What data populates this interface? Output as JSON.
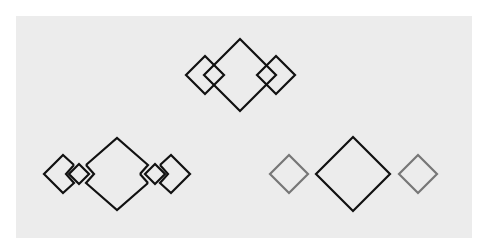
{
  "canvas": {
    "background": "#ffffff",
    "panel_color": "#ececec"
  },
  "colors": {
    "dark": "#111111",
    "gray": "#777777",
    "panel": "#ececec"
  },
  "figures": [
    {
      "name": "top-group",
      "description": "large diamond overlapped by two small diamonds on each tip",
      "big": {
        "cx": 240,
        "cy": 75,
        "r": 36
      },
      "small": [
        {
          "cx": 205,
          "cy": 75,
          "r": 19
        },
        {
          "cx": 276,
          "cy": 75,
          "r": 19
        }
      ]
    },
    {
      "name": "bottom-left-group",
      "description": "large diamond with notched tips, tiny diamonds in gaps, clipped outer diamonds",
      "big": {
        "cx": 117,
        "cy": 174,
        "r": 36
      },
      "small": [
        {
          "cx": 82,
          "cy": 174,
          "r": 10
        },
        {
          "cx": 152,
          "cy": 174,
          "r": 10
        }
      ],
      "outer": [
        {
          "cx": 63,
          "cy": 174,
          "r": 19
        },
        {
          "cx": 171,
          "cy": 174,
          "r": 19
        }
      ]
    },
    {
      "name": "bottom-right-group",
      "description": "large dark diamond flanked by two separate gray diamonds",
      "big": {
        "cx": 353,
        "cy": 174,
        "r": 37
      },
      "small": [
        {
          "cx": 289,
          "cy": 174,
          "r": 19
        },
        {
          "cx": 418,
          "cy": 174,
          "r": 19
        }
      ]
    }
  ]
}
